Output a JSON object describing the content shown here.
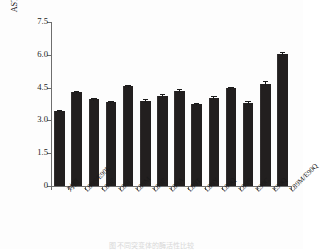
{
  "chart_data": {
    "type": "bar",
    "title": "",
    "xlabel": "",
    "ylabel": "ASTⅣ 酶活性(U/mL)",
    "ylim": [
      0,
      7.5
    ],
    "yticks": [
      0,
      1.5,
      3.0,
      4.5,
      6.0,
      7.5
    ],
    "ytick_labels": [
      "0",
      "1.5",
      "3.0",
      "4.5",
      "6.0",
      "7.5"
    ],
    "grid": false,
    "legend": "none",
    "bar_color": "#221f1f",
    "categories": [
      "对照",
      "L89S/E90L",
      "L89E",
      "L89I",
      "L89M",
      "L89F",
      "L89A",
      "L89T",
      "L89Y",
      "L89Q",
      "L89S",
      "E90C",
      "E90Q",
      "L89M/E90Q"
    ],
    "values": [
      3.45,
      4.28,
      3.96,
      3.86,
      4.57,
      3.9,
      4.12,
      4.36,
      3.73,
      4.04,
      4.46,
      3.81,
      4.67,
      6.04
    ],
    "errors": [
      0.04,
      0.05,
      0.05,
      0.04,
      0.06,
      0.06,
      0.08,
      0.06,
      0.05,
      0.09,
      0.07,
      0.06,
      0.12,
      0.09
    ],
    "series": [
      {
        "name": "ASTⅣ 酶活性",
        "values": [
          3.45,
          4.28,
          3.96,
          3.86,
          4.57,
          3.9,
          4.12,
          4.36,
          3.73,
          4.04,
          4.46,
          3.81,
          4.67,
          6.04
        ]
      }
    ]
  },
  "caption": {
    "text": "图 不同突变体的酶活性比较"
  }
}
